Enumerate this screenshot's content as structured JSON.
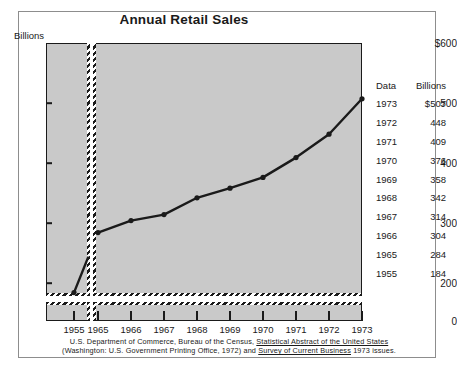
{
  "title": "Annual Retail Sales",
  "unit_label": "Billions",
  "axis": {
    "y_ticks": [
      "$600",
      "500",
      "400",
      "300",
      "200",
      "0"
    ],
    "y_values": [
      600,
      500,
      400,
      300,
      200,
      0
    ],
    "x_ticks": [
      "1955",
      "1965",
      "1966",
      "1967",
      "1968",
      "1969",
      "1970",
      "1971",
      "1972",
      "1973"
    ]
  },
  "table": {
    "header": {
      "year": "Data",
      "value": "Billions"
    },
    "rows": [
      {
        "year": "1973",
        "value": "$507"
      },
      {
        "year": "1972",
        "value": "448"
      },
      {
        "year": "1971",
        "value": "409"
      },
      {
        "year": "1970",
        "value": "376"
      },
      {
        "year": "1969",
        "value": "358"
      },
      {
        "year": "1968",
        "value": "342"
      },
      {
        "year": "1967",
        "value": "314"
      },
      {
        "year": "1966",
        "value": "304"
      },
      {
        "year": "1965",
        "value": "284"
      },
      {
        "year": "1955",
        "value": "184"
      }
    ]
  },
  "footnote": {
    "line1_a": "U.S. Department of Commerce, Bureau of the Census, ",
    "line1_b": "Statistical Abstract of the United States",
    "line2_a": "(Washington:  U.S. Government Printing Office, 1972) and ",
    "line2_b": "Survey of Current Business",
    "line2_c": " 1973 issues."
  },
  "colors": {
    "panel_fill": "#c9c9c9",
    "line": "#1a1a1a",
    "frame": "#8d8d8d",
    "page": "#ffffff"
  },
  "chart_data": {
    "type": "line",
    "title": "Annual Retail Sales",
    "xlabel": "",
    "ylabel": "Billions",
    "ylim": [
      180,
      600
    ],
    "y_axis_break": true,
    "y_break_note": "axis broken below 180; separate zero strip drawn at base",
    "grid": false,
    "legend": "none",
    "x": [
      "1955",
      "1965",
      "1966",
      "1967",
      "1968",
      "1969",
      "1970",
      "1971",
      "1972",
      "1973"
    ],
    "series": [
      {
        "name": "Annual Retail Sales (billions of dollars)",
        "values": [
          184,
          284,
          304,
          314,
          342,
          358,
          376,
          409,
          448,
          507
        ]
      }
    ],
    "panels": [
      {
        "name": "left-panel",
        "x": [
          "1955"
        ],
        "values": [
          184
        ]
      },
      {
        "name": "main-panel",
        "x": [
          "1965",
          "1966",
          "1967",
          "1968",
          "1969",
          "1970",
          "1971",
          "1972",
          "1973"
        ],
        "values": [
          284,
          304,
          314,
          342,
          358,
          376,
          409,
          448,
          507
        ]
      }
    ]
  }
}
